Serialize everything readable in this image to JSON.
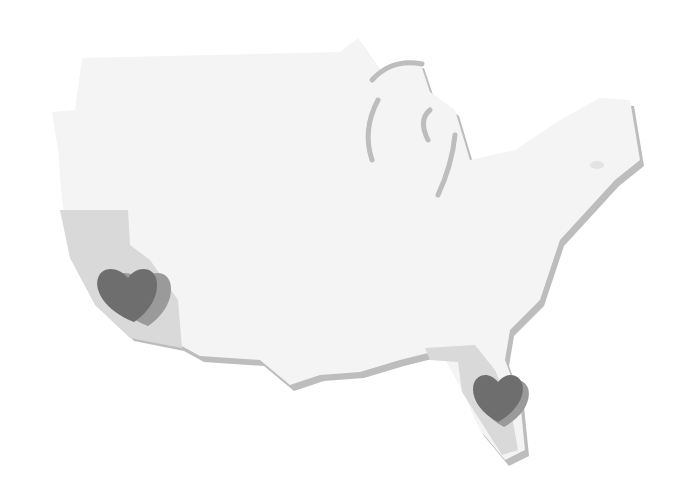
{
  "illustration": {
    "subject": "United States map with heart markers",
    "style": "grayscale paper-cutout",
    "colors": {
      "background": "#ffffff",
      "map_fill": "#f4f4f4",
      "map_shadow": "#bdbdbd",
      "highlight_state": "#d9d9d9",
      "heart": "#6e6e6e",
      "heart_shadow": "#9a9a9a"
    },
    "markers": [
      {
        "name": "california-heart",
        "region": "California",
        "icon": "heart-icon"
      },
      {
        "name": "florida-heart",
        "region": "Florida",
        "icon": "heart-icon"
      }
    ]
  }
}
